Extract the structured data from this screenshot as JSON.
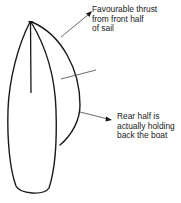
{
  "diagram": {
    "colors": {
      "stroke": "#1a1a1a",
      "background": "#ffffff"
    },
    "annotations": [
      {
        "id": "front-thrust",
        "lines": [
          "Favourable thrust",
          "from front half",
          "of sail"
        ]
      },
      {
        "id": "rear-drag",
        "lines": [
          "Rear half is",
          "actually holding",
          "back the boat"
        ]
      }
    ]
  }
}
